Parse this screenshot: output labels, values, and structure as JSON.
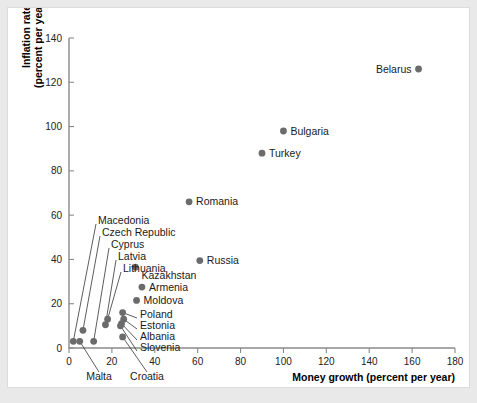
{
  "figure": {
    "background_color": "#ffffff",
    "page_background_color": "#e9e9e9",
    "dot_color": "#6b6b6b",
    "axis_color": "#8a8a8a"
  },
  "chart_data": {
    "type": "scatter",
    "title": "",
    "xlabel": "Money growth (percent per year)",
    "ylabel": "Inflation rate\n(percent per year)",
    "ylabel_line1": "Inflation rate",
    "ylabel_line2": "(percent per year)",
    "xlim": [
      0,
      180
    ],
    "ylim": [
      0,
      140
    ],
    "xticks": [
      0,
      20,
      40,
      60,
      80,
      100,
      120,
      140,
      160,
      180
    ],
    "yticks": [
      0,
      20,
      40,
      60,
      80,
      100,
      120,
      140
    ],
    "grid": false,
    "legend": null,
    "points": [
      {
        "name": "Belarus",
        "x": 163.0,
        "y": 126.0,
        "label_pos": "left"
      },
      {
        "name": "Bulgaria",
        "x": 100.0,
        "y": 98.0,
        "label_pos": "right"
      },
      {
        "name": "Turkey",
        "x": 90.0,
        "y": 88.0,
        "label_pos": "right"
      },
      {
        "name": "Romania",
        "x": 56.0,
        "y": 66.0,
        "label_pos": "right"
      },
      {
        "name": "Russia",
        "x": 61.0,
        "y": 39.5,
        "label_pos": "right"
      },
      {
        "name": "Kazakhstan",
        "x": 31.0,
        "y": 36.5,
        "label_pos": "right-below"
      },
      {
        "name": "Armenia",
        "x": 34.0,
        "y": 27.5,
        "label_pos": "right"
      },
      {
        "name": "Moldova",
        "x": 31.5,
        "y": 21.5,
        "label_pos": "right"
      },
      {
        "name": "Poland",
        "x": 25.0,
        "y": 16.0,
        "label_pos": "leader-right"
      },
      {
        "name": "Estonia",
        "x": 25.5,
        "y": 13.0,
        "label_pos": "leader-right"
      },
      {
        "name": "Albania",
        "x": 24.5,
        "y": 11.0,
        "label_pos": "leader-right"
      },
      {
        "name": "Slovenia",
        "x": 24.0,
        "y": 10.0,
        "label_pos": "leader-right"
      },
      {
        "name": "Croatia",
        "x": 25.0,
        "y": 5.0,
        "label_pos": "leader-below"
      },
      {
        "name": "Malta",
        "x": 5.0,
        "y": 3.0,
        "label_pos": "leader-below"
      },
      {
        "name": "Macedonia",
        "x": 2.0,
        "y": 3.0,
        "label_pos": "leader-upright"
      },
      {
        "name": "Czech Republic",
        "x": 6.5,
        "y": 8.0,
        "label_pos": "leader-upright"
      },
      {
        "name": "Cyprus",
        "x": 11.5,
        "y": 3.0,
        "label_pos": "leader-upright"
      },
      {
        "name": "Latvia",
        "x": 17.0,
        "y": 10.5,
        "label_pos": "leader-upright"
      },
      {
        "name": "Lithuania",
        "x": 18.0,
        "y": 13.0,
        "label_pos": "leader-upright"
      }
    ],
    "leader_labels": [
      {
        "name": "Macedonia",
        "text": "Macedonia"
      },
      {
        "name": "Czech Republic",
        "text": "Czech Republic"
      },
      {
        "name": "Cyprus",
        "text": "Cyprus"
      },
      {
        "name": "Latvia",
        "text": "Latvia"
      },
      {
        "name": "Lithuania",
        "text": "Lithuania"
      },
      {
        "name": "Poland",
        "text": "Poland"
      },
      {
        "name": "Estonia",
        "text": "Estonia"
      },
      {
        "name": "Albania",
        "text": "Albania"
      },
      {
        "name": "Slovenia",
        "text": "Slovenia"
      },
      {
        "name": "Malta",
        "text": "Malta"
      },
      {
        "name": "Croatia",
        "text": "Croatia"
      }
    ]
  },
  "labels": {
    "x_axis_title": "Money growth (percent per year)",
    "y_axis_title_line1": "Inflation rate",
    "y_axis_title_line2": "(percent per year)",
    "belarus": "Belarus",
    "bulgaria": "Bulgaria",
    "turkey": "Turkey",
    "romania": "Romania",
    "russia": "Russia",
    "kazakhstan": "Kazakhstan",
    "armenia": "Armenia",
    "moldova": "Moldova",
    "poland": "Poland",
    "estonia": "Estonia",
    "albania": "Albania",
    "slovenia": "Slovenia",
    "croatia": "Croatia",
    "malta": "Malta",
    "macedonia": "Macedonia",
    "czech_republic": "Czech Republic",
    "cyprus": "Cyprus",
    "latvia": "Latvia",
    "lithuania": "Lithuania"
  },
  "ticks": {
    "x": [
      "0",
      "20",
      "40",
      "60",
      "80",
      "100",
      "120",
      "140",
      "160",
      "180"
    ],
    "y": [
      "0",
      "20",
      "40",
      "60",
      "80",
      "100",
      "120",
      "140"
    ]
  }
}
